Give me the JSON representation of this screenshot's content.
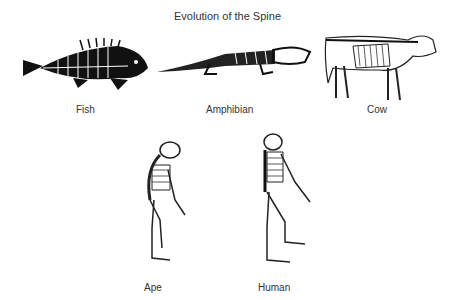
{
  "title": "Evolution of the Spine",
  "figures": [
    {
      "id": "fish",
      "label": "Fish"
    },
    {
      "id": "amphibian",
      "label": "Amphibian"
    },
    {
      "id": "cow",
      "label": "Cow"
    },
    {
      "id": "ape",
      "label": "Ape"
    },
    {
      "id": "human",
      "label": "Human"
    }
  ]
}
